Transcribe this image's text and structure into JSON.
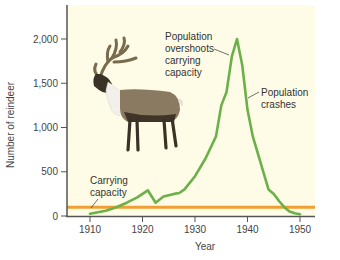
{
  "chart_data": {
    "type": "line",
    "title": "",
    "xlabel": "Year",
    "ylabel": "Number of reindeer",
    "xlim": [
      1906,
      1953
    ],
    "ylim": [
      0,
      2250
    ],
    "x_ticks": [
      1910,
      1920,
      1930,
      1940,
      1950
    ],
    "y_ticks": [
      0,
      500,
      1000,
      1500,
      2000
    ],
    "x_tick_labels": [
      "1910",
      "1920",
      "1930",
      "1940",
      "1950"
    ],
    "y_tick_labels": [
      "0",
      "500",
      "1,000",
      "1,500",
      "2,000"
    ],
    "grid": false,
    "legend": null,
    "background_color": "#fefce6",
    "series": [
      {
        "name": "Reindeer population",
        "color": "#6cb04a",
        "x": [
          1910,
          1913,
          1915,
          1917,
          1919,
          1921,
          1922.5,
          1924,
          1926,
          1927,
          1928,
          1930,
          1932,
          1934,
          1935,
          1936,
          1937,
          1938,
          1939,
          1940,
          1941,
          1943,
          1944,
          1945,
          1946,
          1947,
          1948,
          1949,
          1950
        ],
        "values": [
          25,
          60,
          100,
          150,
          210,
          290,
          150,
          220,
          250,
          260,
          300,
          450,
          650,
          900,
          1250,
          1400,
          1800,
          2000,
          1700,
          1200,
          900,
          500,
          300,
          250,
          170,
          100,
          50,
          30,
          20
        ]
      },
      {
        "name": "Carrying capacity",
        "color": "#f0a030",
        "x": [
          1906,
          1953
        ],
        "values": [
          100,
          100
        ]
      }
    ],
    "annotations": [
      {
        "text": "Carrying capacity",
        "x": 1911,
        "y": 400,
        "points_to": [
          1910.5,
          100
        ]
      },
      {
        "text": "Population overshoots carrying capacity",
        "x": 1928,
        "y": 1850,
        "points_to": [
          1937,
          1750
        ]
      },
      {
        "text": "Population crashes",
        "x": 1941,
        "y": 1150,
        "points_to": [
          1939.5,
          1300
        ]
      }
    ]
  },
  "labels": {
    "ylabel": "Number of reindeer",
    "xlabel": "Year",
    "carrying_line1": "Carrying",
    "carrying_line2": "capacity",
    "overshoot_line1": "Population",
    "overshoot_line2": "overshoots",
    "overshoot_line3": "carrying",
    "overshoot_line4": "capacity",
    "crash_line1": "Population",
    "crash_line2": "crashes"
  },
  "illustration": {
    "subject": "reindeer"
  }
}
